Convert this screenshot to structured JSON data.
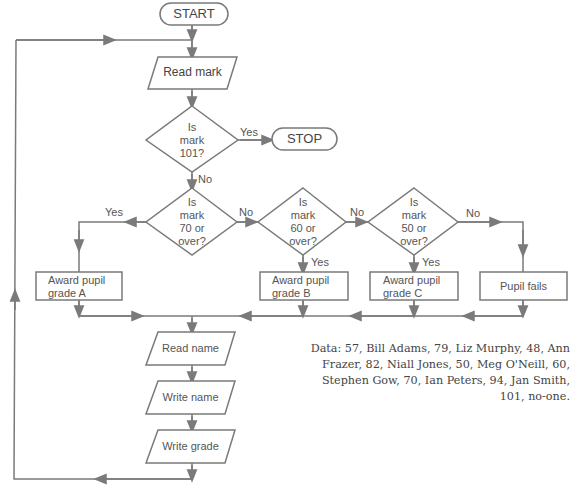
{
  "flowchart": {
    "start": "START",
    "stop": "STOP",
    "read_mark": "Read mark",
    "decision_101": [
      "Is",
      "mark",
      "101?"
    ],
    "decision_70": [
      "Is",
      "mark",
      "70 or",
      "over?"
    ],
    "decision_60": [
      "Is",
      "mark",
      "60 or",
      "over?"
    ],
    "decision_50": [
      "Is",
      "mark",
      "50 or",
      "over?"
    ],
    "grade_a": [
      "Award pupil",
      "grade A"
    ],
    "grade_b": [
      "Award pupil",
      "grade B"
    ],
    "grade_c": [
      "Award pupil",
      "grade C"
    ],
    "fails": "Pupil fails",
    "read_name": "Read name",
    "write_name": "Write name",
    "write_grade": "Write grade",
    "labels": {
      "yes": "Yes",
      "no": "No"
    }
  },
  "data_note": "Data: 57, Bill Adams, 79, Liz Murphy, 48, Ann Frazer, 82, Niall Jones, 50, Meg O'Neill, 60, Stephen Gow, 70, Ian Peters, 94, Jan Smith, 101, no-one.",
  "colors": {
    "line": "#7a7a7a",
    "text": "#444444",
    "background": "#ffffff"
  }
}
